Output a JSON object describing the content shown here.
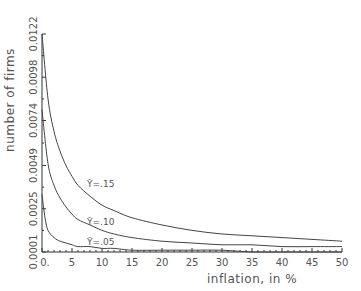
{
  "chart_data": {
    "type": "line",
    "title": "",
    "xlabel": "inflation, in %",
    "ylabel": "number of firms",
    "xlim": [
      0,
      50
    ],
    "ylim": [
      0.0001,
      0.0122
    ],
    "x_ticks": [
      0,
      5,
      10,
      15,
      20,
      25,
      30,
      35,
      40,
      45,
      50
    ],
    "x_tick_labels": [
      "0.",
      "5",
      "10",
      "15",
      "20",
      "25",
      "30",
      "35",
      "40",
      "45",
      "50"
    ],
    "y_ticks": [
      0.0001,
      0.0025,
      0.0049,
      0.0074,
      0.0098,
      0.0122
    ],
    "y_tick_labels": [
      "0.0001",
      "0.0025",
      "0.0049",
      "0.0074",
      "0.0098",
      "0.0122"
    ],
    "grid": false,
    "legend": "none",
    "series": [
      {
        "name": "Ȳ=.15",
        "x": [
          0,
          1,
          2,
          3,
          4,
          5,
          6,
          8,
          10,
          12,
          15,
          20,
          25,
          30,
          35,
          40,
          45,
          50
        ],
        "y": [
          0.0122,
          0.0086,
          0.0068,
          0.0057,
          0.0049,
          0.0043,
          0.0038,
          0.0032,
          0.0027,
          0.0024,
          0.002,
          0.0016,
          0.0013,
          0.0011,
          0.001,
          0.0009,
          0.0008,
          0.0007
        ]
      },
      {
        "name": "Ȳ=.10",
        "x": [
          0,
          1,
          2,
          3,
          4,
          5,
          6,
          8,
          10,
          12,
          15,
          20,
          25,
          30,
          35,
          40,
          45,
          50
        ],
        "y": [
          0.008,
          0.005,
          0.0038,
          0.0031,
          0.0026,
          0.0022,
          0.0019,
          0.0016,
          0.0013,
          0.0011,
          0.0009,
          0.0007,
          0.0006,
          0.0005,
          0.0005,
          0.0004,
          0.0004,
          0.0004
        ]
      },
      {
        "name": "Ȳ=.05",
        "x": [
          0,
          0.5,
          1,
          2,
          3,
          4,
          5,
          6,
          8,
          10,
          12,
          15,
          20,
          25,
          30,
          35,
          40,
          45,
          50
        ],
        "y": [
          0.0033,
          0.002,
          0.0013,
          0.0009,
          0.0007,
          0.0006,
          0.0005,
          0.0004,
          0.0004,
          0.0003,
          0.0003,
          0.0002,
          0.0002,
          0.0002,
          0.0002,
          0.0001,
          0.0001,
          0.0001,
          0.0001
        ]
      }
    ],
    "annotations": [
      {
        "text": "Ȳ=.15",
        "x": 7.5,
        "y": 0.0037
      },
      {
        "text": "Ȳ=.10",
        "x": 7.5,
        "y": 0.0016
      },
      {
        "text": "Ȳ=.05",
        "x": 7.5,
        "y": 0.0005
      }
    ]
  }
}
